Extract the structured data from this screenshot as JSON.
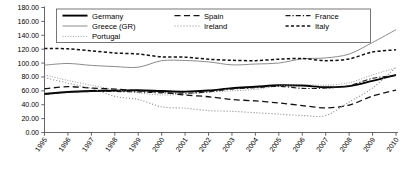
{
  "chart_data": {
    "type": "line",
    "title": "",
    "subtitle": "",
    "xlabel": "",
    "ylabel": "",
    "grid": false,
    "legend_position": "top",
    "x": [
      1995,
      1996,
      1997,
      1998,
      1999,
      2000,
      2001,
      2002,
      2003,
      2004,
      2005,
      2006,
      2007,
      2008,
      2009,
      2010
    ],
    "xtick_labels": [
      "1995",
      "1996",
      "1997",
      "1998",
      "1999",
      "2000",
      "2001",
      "2002",
      "2003",
      "2004",
      "2005",
      "2006",
      "2007",
      "2008",
      "2009",
      "2010"
    ],
    "ylim": [
      0,
      180
    ],
    "ytick_values": [
      0,
      20,
      40,
      60,
      80,
      100,
      120,
      140,
      160,
      180
    ],
    "ytick_labels": [
      "0.00",
      "20.00",
      "40.00",
      "60.00",
      "80.00",
      "100.00",
      "120.00",
      "140.00",
      "160.00",
      "180.00"
    ],
    "series": [
      {
        "name": "Germany",
        "style": "solid-thick",
        "color": "#000000",
        "width": 1.9,
        "dash": "none",
        "values": [
          55.6,
          58.4,
          59.7,
          60.3,
          60.9,
          59.7,
          58.8,
          60.4,
          63.9,
          65.8,
          68.0,
          67.6,
          65.2,
          66.7,
          74.4,
          83.0
        ]
      },
      {
        "name": "Greece (GR)",
        "style": "solid-thin",
        "color": "#8c8c8c",
        "width": 1.0,
        "dash": "none",
        "values": [
          97.0,
          99.4,
          96.6,
          95.0,
          94.0,
          103.4,
          103.7,
          101.7,
          97.4,
          98.6,
          100.0,
          106.1,
          107.4,
          112.9,
          129.7,
          148.0
        ]
      },
      {
        "name": "Portugal",
        "style": "dotted",
        "color": "#9a9a9a",
        "width": 1.0,
        "dash": "1,1.6",
        "values": [
          83.0,
          75.0,
          68.0,
          62.0,
          57.0,
          54.0,
          55.0,
          58.0,
          60.0,
          62.0,
          67.0,
          69.0,
          68.0,
          71.6,
          83.0,
          93.0
        ]
      },
      {
        "name": "Spain",
        "style": "dashed-long",
        "color": "#111111",
        "width": 1.3,
        "dash": "6,3.5",
        "values": [
          63.0,
          66.0,
          64.0,
          62.5,
          60.0,
          58.0,
          54.0,
          51.5,
          47.5,
          45.5,
          42.5,
          38.8,
          35.5,
          39.5,
          52.5,
          61.0
        ]
      },
      {
        "name": "Ireland",
        "style": "dotted",
        "color": "#8f8f8f",
        "width": 1.1,
        "dash": "1.1,1.9",
        "values": [
          79.0,
          71.0,
          63.5,
          52.0,
          47.5,
          37.0,
          35.0,
          31.5,
          30.5,
          28.5,
          26.5,
          24.5,
          24.5,
          44.0,
          64.0,
          94.0
        ]
      },
      {
        "name": "France",
        "style": "dash-dot",
        "color": "#1a1a1a",
        "width": 1.1,
        "dash": "5,2,1.3,2",
        "values": [
          55.0,
          58.0,
          59.0,
          59.0,
          58.5,
          57.0,
          56.5,
          58.5,
          62.5,
          64.5,
          66.5,
          63.5,
          64.0,
          67.5,
          78.0,
          82.0
        ]
      },
      {
        "name": "Italy",
        "style": "dashed-short",
        "color": "#111111",
        "width": 1.5,
        "dash": "3.2,2.2",
        "values": [
          121.0,
          120.5,
          117.5,
          114.5,
          113.0,
          109.0,
          108.5,
          105.5,
          104.0,
          103.5,
          105.5,
          106.5,
          103.5,
          106.0,
          116.0,
          119.0
        ]
      }
    ]
  },
  "legend": {
    "entries": [
      {
        "label": "Germany"
      },
      {
        "label": "Spain"
      },
      {
        "label": "France"
      },
      {
        "label": "Greece (GR)"
      },
      {
        "label": "Ireland"
      },
      {
        "label": "Italy"
      },
      {
        "label": "Portugal"
      }
    ]
  }
}
